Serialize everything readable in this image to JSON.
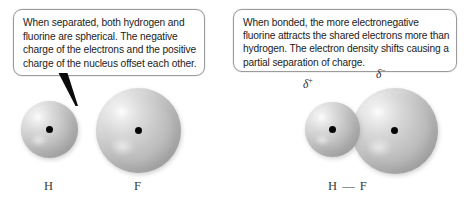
{
  "figure": {
    "background_color": "#ffffff",
    "sphere_color": "#c0c0c0",
    "nucleus_color": "#060606",
    "callout_border_color": "#9b9b9b"
  },
  "panels": [
    {
      "id": "separated",
      "callout": {
        "text": "When separated, both hydrogen and fluorine are spherical. The negative charge of the electrons and the positive charge of the nucleus offset each other."
      },
      "atoms": [
        {
          "symbol": "H",
          "name": "hydrogen"
        },
        {
          "symbol": "F",
          "name": "fluorine"
        }
      ]
    },
    {
      "id": "bonded",
      "callout": {
        "text": "When bonded, the more electronegative fluorine attracts the shared electrons more than hydrogen. The electron density shifts causing a partial separation of charge."
      },
      "molecule_label": "H — F",
      "charges": [
        {
          "symbol": "δ",
          "sign": "+",
          "on": "hydrogen"
        },
        {
          "symbol": "δ",
          "sign": "−",
          "on": "fluorine"
        }
      ]
    }
  ]
}
